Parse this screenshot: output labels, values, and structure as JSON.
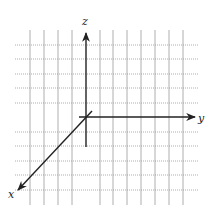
{
  "diagram": {
    "type": "3d-coordinate-axes-on-grid",
    "axes": [
      {
        "name": "x",
        "label": "x",
        "direction": "down-left"
      },
      {
        "name": "y",
        "label": "y",
        "direction": "right"
      },
      {
        "name": "z",
        "label": "z",
        "direction": "up"
      }
    ],
    "grid": {
      "vertical_lines_x": [
        30,
        44,
        58,
        72,
        100,
        113,
        127,
        141,
        155,
        169,
        183
      ],
      "horizontal_lines_y": [
        45,
        59,
        74,
        88,
        103,
        132,
        146,
        161,
        175,
        190
      ],
      "style": "dotted",
      "color": "#9a9a9a"
    },
    "origin": {
      "x": 86,
      "y": 117
    },
    "axis_color": "#222222"
  }
}
